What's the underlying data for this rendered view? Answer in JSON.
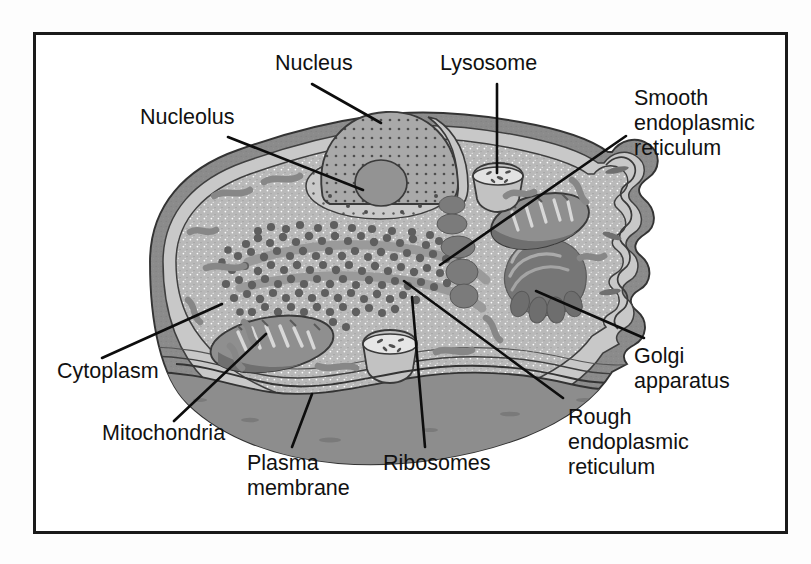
{
  "figure": {
    "frame": {
      "x": 33,
      "y": 32,
      "width": 755,
      "height": 502,
      "border_color": "#1a1a1a"
    }
  },
  "palette": {
    "background": "#ffffff",
    "page": "#fdfdfd",
    "membrane_dark": "#8a8a8a",
    "membrane_mid": "#a8a8a8",
    "cytoplasm": "#b8b8b8",
    "cytoplasm_light": "#c4c4c4",
    "nucleus": "#a0a0a0",
    "nucleus_light": "#c9c9c9",
    "nucleolus": "#8e8e8e",
    "organelle_dark": "#7c7c7c",
    "golgi": "#787878",
    "ribosome": "#6e6e6e",
    "outline": "#3a3a3a",
    "leader": "#0d0d0d",
    "text": "#111111"
  },
  "labels": [
    {
      "id": "nucleus",
      "text": "Nucleus",
      "lines": [
        "Nucleus"
      ],
      "x": 275,
      "y": 70,
      "anchor": "start",
      "leader": {
        "x1": 312,
        "y1": 84,
        "x2": 381,
        "y2": 123
      }
    },
    {
      "id": "lysosome",
      "text": "Lysosome",
      "lines": [
        "Lysosome"
      ],
      "x": 440,
      "y": 70,
      "anchor": "start",
      "leader": {
        "x1": 497,
        "y1": 84,
        "x2": 497,
        "y2": 173
      }
    },
    {
      "id": "nucleolus",
      "text": "Nucleolus",
      "lines": [
        "Nucleolus"
      ],
      "x": 140,
      "y": 124,
      "anchor": "start",
      "leader": {
        "x1": 228,
        "y1": 137,
        "x2": 363,
        "y2": 190
      }
    },
    {
      "id": "smooth-er",
      "text": "Smooth endoplasmic reticulum",
      "lines": [
        "Smooth",
        "endoplasmic",
        "reticulum"
      ],
      "x": 634,
      "y": 105,
      "anchor": "start",
      "leader": {
        "x1": 626,
        "y1": 136,
        "x2": 440,
        "y2": 265
      }
    },
    {
      "id": "cytoplasm",
      "text": "Cytoplasm",
      "lines": [
        "Cytoplasm"
      ],
      "x": 57,
      "y": 378,
      "anchor": "start",
      "leader": {
        "x1": 102,
        "y1": 358,
        "x2": 222,
        "y2": 304
      }
    },
    {
      "id": "golgi-apparatus",
      "text": "Golgi apparatus",
      "lines": [
        "Golgi",
        "apparatus"
      ],
      "x": 634,
      "y": 363,
      "anchor": "start",
      "leader": {
        "x1": 644,
        "y1": 338,
        "x2": 536,
        "y2": 291
      }
    },
    {
      "id": "mitochondria",
      "text": "Mitochondria",
      "lines": [
        "Mitochondria"
      ],
      "x": 102,
      "y": 440,
      "anchor": "start",
      "leader": {
        "x1": 174,
        "y1": 421,
        "x2": 266,
        "y2": 334
      }
    },
    {
      "id": "plasma-membrane",
      "text": "Plasma membrane",
      "lines": [
        "Plasma",
        "membrane"
      ],
      "x": 247,
      "y": 470,
      "anchor": "start",
      "leader": {
        "x1": 292,
        "y1": 447,
        "x2": 312,
        "y2": 394
      }
    },
    {
      "id": "ribosomes",
      "text": "Ribosomes",
      "lines": [
        "Ribosomes"
      ],
      "x": 383,
      "y": 470,
      "anchor": "start",
      "leader": {
        "x1": 425,
        "y1": 447,
        "x2": 412,
        "y2": 297
      }
    },
    {
      "id": "rough-er",
      "text": "Rough endoplasmic reticulum",
      "lines": [
        "Rough",
        "endoplasmic",
        "reticulum"
      ],
      "x": 568,
      "y": 424,
      "anchor": "start",
      "leader": {
        "x1": 563,
        "y1": 398,
        "x2": 404,
        "y2": 281
      }
    }
  ],
  "organelles": [
    {
      "id": "nucleus",
      "name": "Nucleus",
      "count": 1
    },
    {
      "id": "nucleolus",
      "name": "Nucleolus",
      "count": 1
    },
    {
      "id": "lysosome",
      "name": "Lysosome",
      "count": 2
    },
    {
      "id": "mitochondria",
      "name": "Mitochondria",
      "count": 2
    },
    {
      "id": "golgi-apparatus",
      "name": "Golgi apparatus",
      "count": 1
    },
    {
      "id": "rough-er",
      "name": "Rough endoplasmic reticulum",
      "count": 1
    },
    {
      "id": "smooth-er",
      "name": "Smooth endoplasmic reticulum",
      "count": 1
    },
    {
      "id": "ribosomes",
      "name": "Ribosomes",
      "count": 1
    },
    {
      "id": "plasma-membrane",
      "name": "Plasma membrane",
      "count": 1
    },
    {
      "id": "cytoplasm",
      "name": "Cytoplasm",
      "count": 1
    }
  ]
}
